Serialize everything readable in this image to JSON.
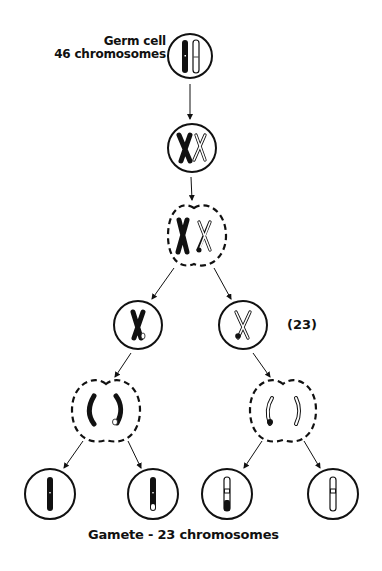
{
  "diagram": {
    "labels": {
      "germ_cell_line1": "Germ cell",
      "germ_cell_line2": "46 chromosomes",
      "haploid_count": "(23)",
      "gamete": "Gamete - 23 chromosomes"
    },
    "stages": [
      {
        "id": "germ-cell",
        "shape": "circle",
        "cx": 190,
        "cy": 56,
        "r": 22,
        "content": "two unreplicated homologous chromosomes (dark and light)"
      },
      {
        "id": "replicated",
        "shape": "circle",
        "cx": 192,
        "cy": 148,
        "r": 24,
        "content": "two replicated homologs (dark X, light X)"
      },
      {
        "id": "meiosis-I",
        "shape": "dashed-cell",
        "cx": 194,
        "cy": 236,
        "content": "paired homologs with crossing over"
      },
      {
        "id": "secondary-left",
        "shape": "circle",
        "cx": 138,
        "cy": 325,
        "r": 24,
        "content": "dark X chromosome with light tip"
      },
      {
        "id": "secondary-right",
        "shape": "circle",
        "cx": 243,
        "cy": 325,
        "r": 24,
        "content": "light X chromosome with dark tip"
      },
      {
        "id": "meiosis-II-left",
        "shape": "dashed-cell",
        "cx": 106,
        "cy": 410,
        "content": "sister chromatids separating"
      },
      {
        "id": "meiosis-II-right",
        "shape": "dashed-cell",
        "cx": 283,
        "cy": 410,
        "content": "sister chromatids separating"
      },
      {
        "id": "gamete-1",
        "shape": "circle",
        "cx": 50,
        "cy": 494,
        "r": 25,
        "content": "all dark chromatid"
      },
      {
        "id": "gamete-2",
        "shape": "circle",
        "cx": 153,
        "cy": 494,
        "r": 25,
        "content": "dark chromatid with light tip"
      },
      {
        "id": "gamete-3",
        "shape": "circle",
        "cx": 227,
        "cy": 494,
        "r": 25,
        "content": "light chromatid with dark tip"
      },
      {
        "id": "gamete-4",
        "shape": "circle",
        "cx": 333,
        "cy": 494,
        "r": 25,
        "content": "all light chromatid"
      }
    ],
    "colors": {
      "ink": "#111111",
      "background": "#ffffff"
    }
  }
}
